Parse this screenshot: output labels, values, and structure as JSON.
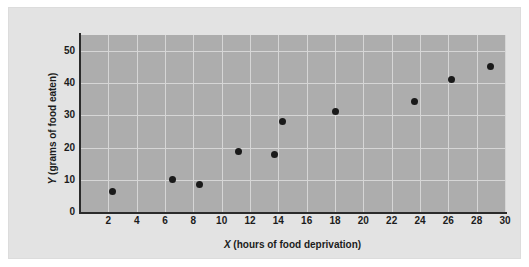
{
  "chart_data": {
    "type": "scatter",
    "title": "",
    "xlabel": "X (hours of food deprivation)",
    "xlabel_var": "X",
    "xlabel_rest": " (hours of food deprivation)",
    "ylabel": "Y (grams of food eaten)",
    "ylabel_var": "Y",
    "ylabel_rest": " (grams of food eaten)",
    "xlim": [
      0,
      30
    ],
    "ylim": [
      0,
      55
    ],
    "xticks": [
      2,
      4,
      6,
      8,
      10,
      12,
      14,
      16,
      18,
      20,
      22,
      24,
      26,
      28,
      30
    ],
    "yticks": [
      0,
      10,
      20,
      30,
      40,
      50
    ],
    "grid": true,
    "legend": "none",
    "x": [
      2.3,
      6.5,
      8.4,
      11.2,
      13.7,
      14.3,
      18.0,
      23.6,
      26.2,
      29.0
    ],
    "y": [
      6.3,
      10.0,
      8.4,
      18.7,
      18.0,
      28.0,
      31.2,
      34.2,
      41.3,
      45.3
    ],
    "points": [
      {
        "x": 2.3,
        "y": 6.3
      },
      {
        "x": 6.5,
        "y": 10.0
      },
      {
        "x": 8.4,
        "y": 8.4
      },
      {
        "x": 11.2,
        "y": 18.7
      },
      {
        "x": 13.7,
        "y": 18.0
      },
      {
        "x": 14.3,
        "y": 28.0
      },
      {
        "x": 18.0,
        "y": 31.2
      },
      {
        "x": 23.6,
        "y": 34.2
      },
      {
        "x": 26.2,
        "y": 41.3
      },
      {
        "x": 29.0,
        "y": 45.3
      }
    ],
    "marker_color": "#1a1a1a",
    "plot_bg_color": "#adadad",
    "figure_bg_color": "#e3e3e3",
    "grid_color": "#d6d6d6",
    "axis_color": "#2b2b2b"
  }
}
